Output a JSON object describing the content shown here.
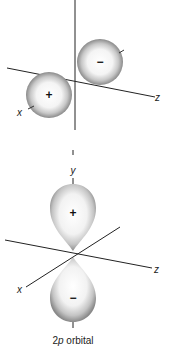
{
  "diagram": {
    "top": {
      "lobes": [
        {
          "sign": "+",
          "position": "lower-left"
        },
        {
          "sign": "−",
          "position": "upper-right"
        }
      ],
      "axes": {
        "x": "x",
        "z": "z"
      }
    },
    "bottom": {
      "lobes": [
        {
          "sign": "+",
          "position": "upper"
        },
        {
          "sign": "−",
          "position": "lower"
        }
      ],
      "axes": {
        "x": "x",
        "y": "y",
        "z": "z"
      }
    },
    "caption": {
      "prefix": "2",
      "italic": "p",
      "suffix": " orbital"
    },
    "colors": {
      "lobe_edge": "#7a7a7a",
      "lobe_center": "#ffffff",
      "axis": "#222222"
    }
  }
}
